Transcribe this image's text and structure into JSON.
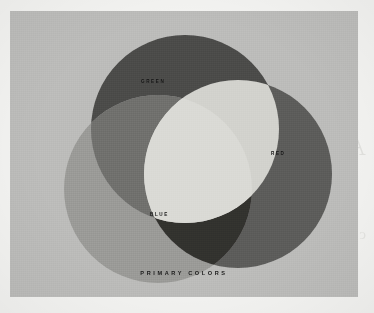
{
  "page": {
    "background_color": "#f3f3f1",
    "plate_color": "#bcbcba",
    "ghost_text_top": "Additive",
    "ghost_text_bottom": "color mixing diagram"
  },
  "figure": {
    "caption": "PRIMARY COLORS",
    "labels": {
      "green": "GREEN",
      "red": "RED",
      "blue": "BLUE"
    }
  },
  "chart_data": {
    "type": "diagram",
    "subtype": "venn",
    "title": "PRIMARY COLORS",
    "rendering": "grayscale halftone reproduction of additive primary colors",
    "sets": [
      {
        "name": "GREEN",
        "label": "GREEN",
        "cx": 175,
        "cy": 118,
        "r": 94,
        "fill": "#4b4b49",
        "label_x": 131,
        "label_y": 68
      },
      {
        "name": "RED",
        "label": "RED",
        "cx": 228,
        "cy": 163,
        "r": 94,
        "fill": "#5c5c5a",
        "label_x": 261,
        "label_y": 140
      },
      {
        "name": "BLUE",
        "label": "BLUE",
        "cx": 148,
        "cy": 178,
        "r": 94,
        "fill": "#9a9a97",
        "label_x": 140,
        "label_y": 201
      }
    ],
    "intersections": [
      {
        "sets": [
          "GREEN",
          "RED"
        ],
        "name": "yellow",
        "fill": "#d2d2cd"
      },
      {
        "sets": [
          "GREEN",
          "BLUE"
        ],
        "name": "cyan",
        "fill": "#6f6f6d"
      },
      {
        "sets": [
          "RED",
          "BLUE"
        ],
        "name": "magenta",
        "fill": "#33312f"
      },
      {
        "sets": [
          "GREEN",
          "RED",
          "BLUE"
        ],
        "name": "white",
        "fill": "#dadad5"
      }
    ],
    "legend_position": "inside-shapes",
    "grid": false
  }
}
